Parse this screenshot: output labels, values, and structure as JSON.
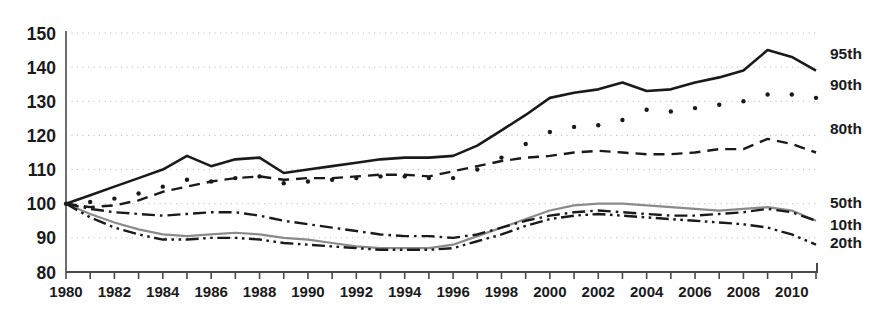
{
  "chart_data": {
    "type": "line",
    "title": "",
    "subtitle": "",
    "xlabel": "",
    "ylabel": "",
    "xlim": [
      1980,
      2011
    ],
    "ylim": [
      80,
      150
    ],
    "ytick_values": [
      80,
      90,
      100,
      110,
      120,
      130,
      140,
      150
    ],
    "ytick_labels": [
      "80",
      "90",
      "100",
      "110",
      "120",
      "130",
      "140",
      "150"
    ],
    "xtick_values": [
      1980,
      1981,
      1982,
      1983,
      1984,
      1985,
      1986,
      1987,
      1988,
      1989,
      1990,
      1991,
      1992,
      1993,
      1994,
      1995,
      1996,
      1997,
      1998,
      1999,
      2000,
      2001,
      2002,
      2003,
      2004,
      2005,
      2006,
      2007,
      2008,
      2009,
      2010,
      2011
    ],
    "xtick_labels_shown": [
      "1980",
      "1982",
      "1984",
      "1986",
      "1988",
      "1990",
      "1992",
      "1994",
      "1996",
      "1998",
      "2000",
      "2002",
      "2004",
      "2006",
      "2008",
      "2010"
    ],
    "grid": "dotted-horizontal",
    "legend_position": "right-inline",
    "x": [
      1980,
      1981,
      1982,
      1983,
      1984,
      1985,
      1986,
      1987,
      1988,
      1989,
      1990,
      1991,
      1992,
      1993,
      1994,
      1995,
      1996,
      1997,
      1998,
      1999,
      2000,
      2001,
      2002,
      2003,
      2004,
      2005,
      2006,
      2007,
      2008,
      2009,
      2010,
      2011
    ],
    "series": [
      {
        "name": "95th",
        "label": "95th",
        "style": "solid",
        "color": "#1a1a1a",
        "width": 2.6,
        "label_y": 144.0,
        "values": [
          100.0,
          102.5,
          105.0,
          107.5,
          110.0,
          114.0,
          111.0,
          113.0,
          113.5,
          109.0,
          110.0,
          111.0,
          112.0,
          113.0,
          113.5,
          113.5,
          114.0,
          117.0,
          121.5,
          126.0,
          131.0,
          132.5,
          133.5,
          135.5,
          133.0,
          133.5,
          135.5,
          137.0,
          139.0,
          145.0,
          143.0,
          139.0
        ]
      },
      {
        "name": "90th",
        "label": "90th",
        "style": "dotted",
        "color": "#1a1a1a",
        "width": 3.4,
        "label_y": 135.0,
        "values": [
          100.0,
          100.5,
          101.5,
          103.0,
          105.0,
          107.0,
          106.5,
          107.5,
          108.0,
          106.0,
          106.5,
          107.0,
          107.5,
          108.0,
          108.0,
          107.5,
          107.5,
          110.0,
          113.5,
          117.5,
          121.0,
          122.5,
          123.0,
          124.5,
          127.5,
          127.0,
          128.0,
          129.0,
          130.0,
          132.0,
          132.0,
          131.0
        ]
      },
      {
        "name": "80th",
        "label": "80th",
        "style": "dashed",
        "color": "#1a1a1a",
        "width": 2.4,
        "label_y": 122.0,
        "values": [
          100.0,
          99.0,
          99.5,
          101.0,
          103.5,
          105.0,
          106.5,
          107.5,
          108.0,
          107.0,
          107.5,
          107.5,
          108.0,
          108.5,
          108.5,
          108.0,
          109.5,
          111.0,
          112.5,
          113.5,
          114.0,
          115.0,
          115.5,
          115.0,
          114.5,
          114.5,
          115.0,
          116.0,
          116.0,
          119.0,
          117.5,
          115.0
        ]
      },
      {
        "name": "50th",
        "label": "50th",
        "style": "solid",
        "color": "#8a8a8a",
        "width": 2.2,
        "label_y": 100.5,
        "values": [
          100.0,
          97.0,
          94.5,
          92.5,
          91.0,
          90.5,
          91.0,
          91.5,
          91.0,
          90.0,
          89.5,
          88.5,
          87.5,
          87.0,
          87.0,
          87.0,
          88.0,
          90.5,
          93.0,
          95.5,
          98.0,
          99.5,
          100.0,
          100.0,
          99.5,
          99.0,
          98.5,
          98.0,
          98.5,
          99.0,
          98.0,
          95.0
        ]
      },
      {
        "name": "10th",
        "label": "10th",
        "style": "dashdot",
        "color": "#1a1a1a",
        "width": 2.4,
        "label_y": 94.0,
        "values": [
          100.0,
          98.5,
          97.5,
          97.0,
          96.5,
          97.0,
          97.5,
          97.5,
          96.5,
          95.0,
          94.0,
          93.0,
          92.0,
          91.0,
          90.5,
          90.5,
          90.0,
          91.0,
          93.0,
          95.0,
          96.5,
          97.5,
          98.0,
          97.5,
          97.0,
          96.5,
          96.5,
          97.0,
          97.5,
          98.5,
          97.5,
          95.0
        ]
      },
      {
        "name": "20th",
        "label": "20th",
        "style": "dashdotdot",
        "color": "#1a1a1a",
        "width": 2.4,
        "label_y": 88.5,
        "values": [
          100.0,
          96.0,
          93.0,
          91.0,
          89.5,
          89.5,
          90.0,
          90.0,
          89.5,
          88.5,
          88.0,
          87.5,
          87.0,
          86.5,
          86.5,
          86.5,
          87.0,
          89.0,
          91.0,
          93.5,
          95.5,
          96.5,
          97.0,
          96.5,
          96.0,
          95.5,
          95.0,
          94.5,
          94.0,
          93.0,
          91.0,
          88.0
        ]
      }
    ]
  }
}
